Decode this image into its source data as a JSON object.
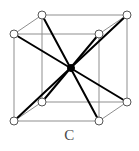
{
  "figure": {
    "caption": "C",
    "colors": {
      "background": "#ffffff",
      "cube_edge": "#8f8f8f",
      "diagonal": "#000000",
      "atom_stroke": "#555555",
      "atom_fill": "#ffffff",
      "center_atom": "#000000",
      "caption_text": "#4a4a4a"
    },
    "style": {
      "cube_edge_width": 1,
      "diagonal_width": 2,
      "atom_radius": 4,
      "center_radius": 3.5
    },
    "atoms": [
      {
        "id": "back-top-left",
        "label": "corner atom",
        "x": 42,
        "y": 15,
        "r": 4
      },
      {
        "id": "back-top-right",
        "label": "corner atom",
        "x": 127,
        "y": 15,
        "r": 4
      },
      {
        "id": "front-top-left",
        "label": "corner atom",
        "x": 14,
        "y": 34,
        "r": 4
      },
      {
        "id": "front-top-right",
        "label": "corner atom",
        "x": 99,
        "y": 34,
        "r": 4
      },
      {
        "id": "back-bottom-left",
        "label": "corner atom",
        "x": 42,
        "y": 102,
        "r": 4
      },
      {
        "id": "back-bottom-right",
        "label": "corner atom",
        "x": 127,
        "y": 102,
        "r": 4
      },
      {
        "id": "front-bottom-left",
        "label": "corner atom",
        "x": 14,
        "y": 121,
        "r": 4
      },
      {
        "id": "front-bottom-right",
        "label": "corner atom",
        "x": 99,
        "y": 121,
        "r": 4
      },
      {
        "id": "body-center",
        "label": "center atom",
        "x": 71,
        "y": 68,
        "r": 3.5
      }
    ],
    "cube_edges": [
      {
        "id": "edge-front-top",
        "x1": 14,
        "y1": 34,
        "x2": 99,
        "y2": 34
      },
      {
        "id": "edge-front-bottom",
        "x1": 14,
        "y1": 121,
        "x2": 99,
        "y2": 121
      },
      {
        "id": "edge-front-left",
        "x1": 14,
        "y1": 34,
        "x2": 14,
        "y2": 121
      },
      {
        "id": "edge-front-right",
        "x1": 99,
        "y1": 34,
        "x2": 99,
        "y2": 121
      },
      {
        "id": "edge-back-top",
        "x1": 42,
        "y1": 15,
        "x2": 127,
        "y2": 15
      },
      {
        "id": "edge-back-bottom",
        "x1": 42,
        "y1": 102,
        "x2": 127,
        "y2": 102
      },
      {
        "id": "edge-back-left",
        "x1": 42,
        "y1": 15,
        "x2": 42,
        "y2": 102
      },
      {
        "id": "edge-back-right",
        "x1": 127,
        "y1": 15,
        "x2": 127,
        "y2": 102
      },
      {
        "id": "edge-depth-top-left",
        "x1": 14,
        "y1": 34,
        "x2": 42,
        "y2": 15
      },
      {
        "id": "edge-depth-top-right",
        "x1": 99,
        "y1": 34,
        "x2": 127,
        "y2": 15
      },
      {
        "id": "edge-depth-bottom-left",
        "x1": 14,
        "y1": 121,
        "x2": 42,
        "y2": 102
      },
      {
        "id": "edge-depth-bottom-right",
        "x1": 99,
        "y1": 121,
        "x2": 127,
        "y2": 102
      }
    ],
    "body_diagonals": [
      {
        "id": "diagonal-ftl-bbr",
        "from": "front-top-left",
        "to": "back-bottom-right",
        "x1": 14,
        "y1": 34,
        "x2": 127,
        "y2": 102
      },
      {
        "id": "diagonal-btr-fbl",
        "from": "back-top-right",
        "to": "front-bottom-left",
        "x1": 127,
        "y1": 15,
        "x2": 14,
        "y2": 121
      },
      {
        "id": "diagonal-btl-fbr",
        "from": "back-top-left",
        "to": "front-bottom-right",
        "x1": 42,
        "y1": 15,
        "x2": 99,
        "y2": 121
      },
      {
        "id": "diagonal-ftr-bbl",
        "from": "front-top-right",
        "to": "back-bottom-left",
        "x1": 99,
        "y1": 34,
        "x2": 42,
        "y2": 102
      }
    ]
  }
}
